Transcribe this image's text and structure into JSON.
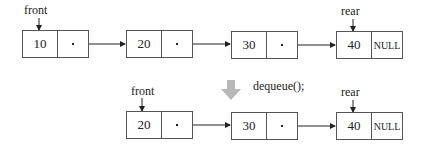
{
  "diagram": {
    "before": {
      "front_label": "front",
      "rear_label": "rear",
      "nodes": [
        {
          "data": "10",
          "next": "pointer"
        },
        {
          "data": "20",
          "next": "pointer"
        },
        {
          "data": "30",
          "next": "pointer"
        },
        {
          "data": "40",
          "next": "NULL"
        }
      ]
    },
    "operation": {
      "label": "dequeue();",
      "arrow_color": "#b8b8b8"
    },
    "after": {
      "front_label": "front",
      "rear_label": "rear",
      "nodes": [
        {
          "data": "20",
          "next": "pointer"
        },
        {
          "data": "30",
          "next": "pointer"
        },
        {
          "data": "40",
          "next": "NULL"
        }
      ]
    }
  }
}
